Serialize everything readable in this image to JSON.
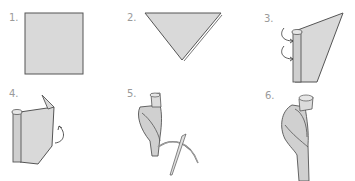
{
  "diagram": {
    "type": "instruction-steps",
    "colors": {
      "paper_fill": "#d9d9d9",
      "outline": "#555555",
      "label": "#9a9a9a",
      "background": "#ffffff"
    },
    "steps": [
      {
        "number": "1.",
        "description": "square sheet of paper"
      },
      {
        "number": "2.",
        "description": "fold diagonally into a triangle"
      },
      {
        "number": "3.",
        "description": "roll the edge inward (arrows)"
      },
      {
        "number": "4.",
        "description": "fold the flap back (curved arrow)"
      },
      {
        "number": "5.",
        "description": "wrap around a stem, secure with needle and thread"
      },
      {
        "number": "6.",
        "description": "finished twisted rolled shape"
      }
    ]
  }
}
